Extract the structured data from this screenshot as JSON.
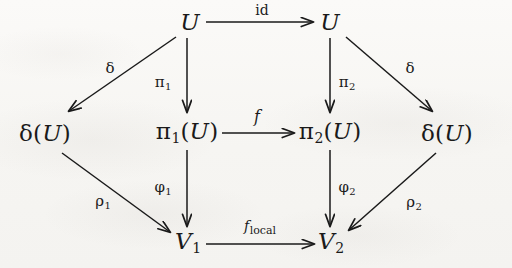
{
  "diagram": {
    "kind": "commutative-diagram",
    "background_color": "#f8f7f5",
    "ink_color": "#1a1a1a",
    "nodes": [
      {
        "id": "u-top-left",
        "label": "U",
        "x": 190,
        "y": 22
      },
      {
        "id": "u-top-right",
        "label": "U",
        "x": 330,
        "y": 22
      },
      {
        "id": "delta-u-left",
        "label": "δ(U)",
        "x": 45,
        "y": 133
      },
      {
        "id": "pi1-u",
        "label": "π₁(U)",
        "x": 187,
        "y": 133
      },
      {
        "id": "pi2-u",
        "label": "π₂(U)",
        "x": 330,
        "y": 133
      },
      {
        "id": "delta-u-right",
        "label": "δ(U)",
        "x": 447,
        "y": 133
      },
      {
        "id": "v1",
        "label": "V₁",
        "x": 188,
        "y": 243
      },
      {
        "id": "v2",
        "label": "V₂",
        "x": 331,
        "y": 243
      }
    ],
    "arrows": [
      {
        "id": "id-arrow",
        "label": "id",
        "from": "u-top-left",
        "to": "u-top-right",
        "label_x": 262,
        "label_y": 10
      },
      {
        "id": "delta-left",
        "label": "δ",
        "from": "u-top-left",
        "to": "delta-u-left",
        "label_x": 110,
        "label_y": 68
      },
      {
        "id": "pi1-arrow",
        "label": "π₁",
        "from": "u-top-left",
        "to": "pi1-u",
        "label_x": 163,
        "label_y": 83
      },
      {
        "id": "pi2-arrow",
        "label": "π₂",
        "from": "u-top-right",
        "to": "pi2-u",
        "label_x": 347,
        "label_y": 83
      },
      {
        "id": "delta-right",
        "label": "δ",
        "from": "u-top-right",
        "to": "delta-u-right",
        "label_x": 410,
        "label_y": 68
      },
      {
        "id": "f-arrow",
        "label": "f",
        "from": "pi1-u",
        "to": "pi2-u",
        "label_x": 257,
        "label_y": 117
      },
      {
        "id": "rho1-arrow",
        "label": "ρ₁",
        "from": "delta-u-left",
        "to": "v1",
        "label_x": 103,
        "label_y": 202
      },
      {
        "id": "phi1-arrow",
        "label": "φ₁",
        "from": "pi1-u",
        "to": "v1",
        "label_x": 163,
        "label_y": 188
      },
      {
        "id": "phi2-arrow",
        "label": "φ₂",
        "from": "pi2-u",
        "to": "v2",
        "label_x": 347,
        "label_y": 188
      },
      {
        "id": "rho2-arrow",
        "label": "ρ₂",
        "from": "delta-u-right",
        "to": "v2",
        "label_x": 414,
        "label_y": 203
      },
      {
        "id": "flocal-arrow",
        "label": "f_local",
        "from": "v1",
        "to": "v2",
        "label_x": 260,
        "label_y": 228
      }
    ]
  },
  "labels": {
    "node_u": "U",
    "node_delta_u": "δ(U)",
    "node_pi1_u_base": "π",
    "node_pi1_u_sub": "1",
    "node_pi1_u_tail": "(U)",
    "node_pi2_u_sub": "2",
    "node_v": "V",
    "node_v1_sub": "1",
    "node_v2_sub": "2",
    "arrow_id": "id",
    "arrow_delta": "δ",
    "arrow_pi": "π",
    "arrow_pi1_sub": "1",
    "arrow_pi2_sub": "2",
    "arrow_f": "f",
    "arrow_phi": "φ",
    "arrow_phi1_sub": "1",
    "arrow_phi2_sub": "2",
    "arrow_rho": "ρ",
    "arrow_rho1_sub": "1",
    "arrow_rho2_sub": "2",
    "arrow_flocal_base": "f",
    "arrow_flocal_sub": "local"
  }
}
